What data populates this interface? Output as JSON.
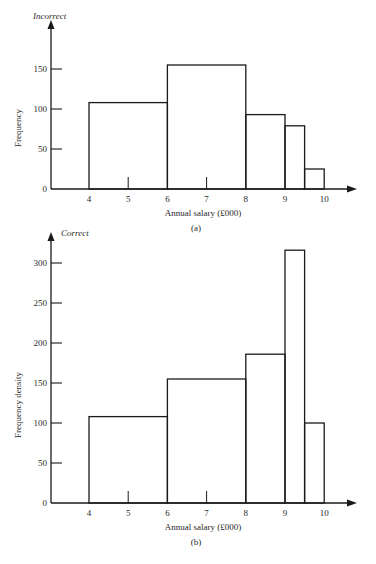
{
  "chart_data": [
    {
      "type": "bar",
      "panel": "(a)",
      "title": "Incorrect",
      "xlabel": "Annual salary (£000)",
      "ylabel": "Frequency",
      "ylim": [
        0,
        180
      ],
      "yticks": [
        0,
        50,
        100,
        150
      ],
      "xticks": [
        4,
        5,
        6,
        7,
        8,
        9,
        10
      ],
      "bins": [
        {
          "from": 4,
          "to": 6,
          "value": 108
        },
        {
          "from": 6,
          "to": 8,
          "value": 155
        },
        {
          "from": 8,
          "to": 9,
          "value": 93
        },
        {
          "from": 9,
          "to": 9.5,
          "value": 79
        },
        {
          "from": 9.5,
          "to": 10,
          "value": 25
        }
      ]
    },
    {
      "type": "bar",
      "panel": "(b)",
      "title": "Correct",
      "xlabel": "Annual salary (£000)",
      "ylabel": "Frequency density",
      "ylim": [
        0,
        340
      ],
      "yticks": [
        0,
        50,
        100,
        150,
        200,
        250,
        300
      ],
      "xticks": [
        4,
        5,
        6,
        7,
        8,
        9,
        10
      ],
      "bins": [
        {
          "from": 4,
          "to": 6,
          "value": 108
        },
        {
          "from": 6,
          "to": 8,
          "value": 155
        },
        {
          "from": 8,
          "to": 9,
          "value": 186
        },
        {
          "from": 9,
          "to": 9.5,
          "value": 316
        },
        {
          "from": 9.5,
          "to": 10,
          "value": 100
        }
      ]
    }
  ],
  "layout": [
    {
      "origin_y": 189,
      "top_y": 20,
      "scale": 0.8
    },
    {
      "origin_y": 503,
      "top_y": 232,
      "scale": 0.8
    }
  ],
  "x_axis": {
    "axis_x": 51,
    "x_at_4": 89,
    "px_per_unit": 39.2,
    "end_x": 357
  }
}
